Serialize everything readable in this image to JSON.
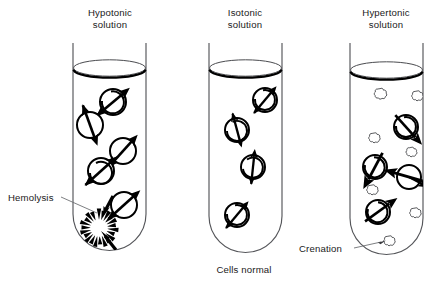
{
  "figure": {
    "background_color": "#ffffff",
    "ink_color": "#000000",
    "glass_color": "#55565a"
  },
  "tubes": [
    {
      "id": "hypotonic",
      "label_line1": "Hypotonic",
      "label_line2": "solution",
      "outcome": "Hemolysis",
      "cell_state": "swollen-bursting",
      "water_direction": "into cell",
      "cell_count": 5,
      "cells": [
        {
          "cx": 113,
          "cy": 102,
          "r": 13,
          "arrow_angle": 35
        },
        {
          "cx": 90,
          "cy": 125,
          "r": 13,
          "arrow_angle": 108
        },
        {
          "cx": 123,
          "cy": 151,
          "r": 13,
          "arrow_angle": 48
        },
        {
          "cx": 101,
          "cy": 171,
          "r": 13,
          "arrow_angle": 40
        },
        {
          "cx": 124,
          "cy": 205,
          "r": 13,
          "arrow_angle": 42
        }
      ],
      "burst": {
        "cx": 99,
        "cy": 228,
        "r": 16,
        "spikes": 22
      }
    },
    {
      "id": "isotonic",
      "label_line1": "Isotonic",
      "label_line2": "solution",
      "outcome": "Cells normal",
      "cell_state": "normal",
      "water_direction": "balanced",
      "cell_count": 4,
      "cells": [
        {
          "cx": 265,
          "cy": 100,
          "r": 12,
          "arrow_angle": 38
        },
        {
          "cx": 237,
          "cy": 130,
          "r": 12,
          "arrow_angle": 110
        },
        {
          "cx": 253,
          "cy": 167,
          "r": 12,
          "arrow_angle": 88
        },
        {
          "cx": 237,
          "cy": 215,
          "r": 12,
          "arrow_angle": 48
        }
      ]
    },
    {
      "id": "hypertonic",
      "label_line1": "Hypertonic",
      "label_line2": "solution",
      "outcome": "Crenation",
      "cell_state": "shrunken-crenated",
      "water_direction": "out of cell",
      "cell_count": 4,
      "cells": [
        {
          "cx": 406,
          "cy": 127,
          "r": 12,
          "arrow_angle": 48
        },
        {
          "cx": 375,
          "cy": 167,
          "r": 12,
          "arrow_angle": 42
        },
        {
          "cx": 409,
          "cy": 177,
          "r": 12,
          "arrow_angle": 215
        },
        {
          "cx": 378,
          "cy": 212,
          "r": 12,
          "arrow_angle": 35
        }
      ],
      "crenated": [
        {
          "cx": 380,
          "cy": 94,
          "r": 5.2
        },
        {
          "cx": 417,
          "cy": 96,
          "r": 4.8
        },
        {
          "cx": 374,
          "cy": 138,
          "r": 4.8
        },
        {
          "cx": 411,
          "cy": 152,
          "r": 4.6
        },
        {
          "cx": 372,
          "cy": 190,
          "r": 4.8
        },
        {
          "cx": 415,
          "cy": 213,
          "r": 4.8
        },
        {
          "cx": 389,
          "cy": 241,
          "r": 4.8
        }
      ]
    }
  ],
  "callouts": [
    {
      "id": "hemolysis-callout",
      "text": "Hemolysis",
      "text_x": 8,
      "text_y": 201,
      "line_from_x": 61,
      "line_from_y": 197,
      "line_to_x": 97,
      "line_to_y": 213
    },
    {
      "id": "crenation-callout",
      "text": "Crenation",
      "text_x": 299,
      "text_y": 252,
      "line_from_x": 354,
      "line_from_y": 248,
      "line_to_x": 384,
      "line_to_y": 242
    }
  ],
  "captions": [
    {
      "id": "cells-normal-caption",
      "text": "Cells normal",
      "x": 244,
      "y": 273
    }
  ],
  "geometry": {
    "tube_positions": [
      {
        "id": "hypotonic",
        "left": 73,
        "right": 146,
        "top": 43,
        "bottom": 250,
        "label_x": 110,
        "rim_y": 68
      },
      {
        "id": "isotonic",
        "left": 209,
        "right": 282,
        "top": 43,
        "bottom": 252,
        "label_x": 245,
        "rim_y": 68
      },
      {
        "id": "hypertonic",
        "left": 350,
        "right": 423,
        "top": 43,
        "bottom": 254,
        "label_x": 386,
        "rim_y": 70
      }
    ],
    "label_y_line1": 16,
    "label_y_line2": 28
  }
}
